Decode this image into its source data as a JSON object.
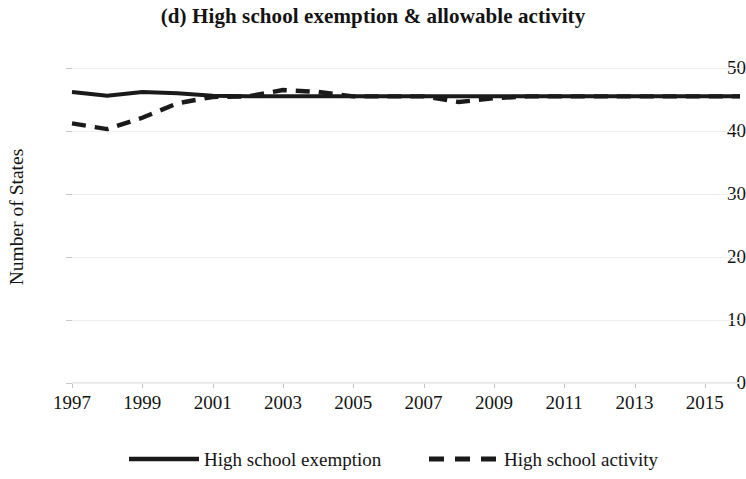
{
  "chart_data": {
    "type": "line",
    "title": "(d) High school exemption & allowable activity",
    "xlabel": "",
    "ylabel": "Number of States",
    "xlim": [
      1997,
      2016
    ],
    "ylim": [
      0,
      50
    ],
    "y_ticks": [
      0,
      10,
      20,
      30,
      40,
      50
    ],
    "x_ticks": [
      1997,
      1999,
      2001,
      2003,
      2005,
      2007,
      2009,
      2011,
      2013,
      2015
    ],
    "grid": "horizontal",
    "legend_position": "bottom",
    "x": [
      1997,
      1998,
      1999,
      2000,
      2001,
      2002,
      2003,
      2004,
      2005,
      2006,
      2007,
      2008,
      2009,
      2010,
      2011,
      2012,
      2013,
      2014,
      2015,
      2016
    ],
    "series": [
      {
        "name": "High school exemption",
        "style": "solid",
        "color": "#1a1a1a",
        "values": [
          46.2,
          45.6,
          46.2,
          46.0,
          45.6,
          45.5,
          45.5,
          45.5,
          45.5,
          45.5,
          45.5,
          45.5,
          45.5,
          45.5,
          45.5,
          45.5,
          45.5,
          45.5,
          45.5,
          45.5
        ]
      },
      {
        "name": "High school activity",
        "style": "dashed",
        "color": "#1a1a1a",
        "values": [
          41.2,
          40.3,
          42.1,
          44.4,
          45.4,
          45.5,
          46.5,
          46.2,
          45.5,
          45.5,
          45.5,
          44.6,
          45.2,
          45.5,
          45.5,
          45.5,
          45.5,
          45.5,
          45.5,
          45.5
        ]
      }
    ]
  },
  "legend": {
    "entries": [
      {
        "label": "High school exemption",
        "swatch": "solid-line-swatch"
      },
      {
        "label": "High school activity",
        "swatch": "dashed-line-swatch"
      }
    ]
  },
  "axes": {
    "y_title": "Number of States",
    "y_labels": [
      "50",
      "40",
      "30",
      "20",
      "10",
      "0"
    ],
    "x_labels": [
      "1997",
      "1999",
      "2001",
      "2003",
      "2005",
      "2007",
      "2009",
      "2011",
      "2013",
      "2015"
    ]
  }
}
